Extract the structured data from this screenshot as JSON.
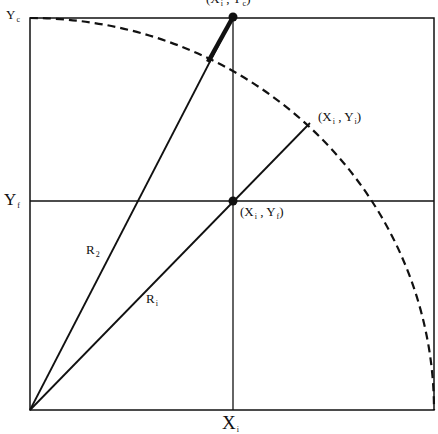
{
  "diagram": {
    "labels": {
      "y_c": {
        "main": "Y",
        "sub": "c"
      },
      "y_f": {
        "main": "Y",
        "sub": "f"
      },
      "x_i": {
        "main": "X",
        "sub": "i"
      },
      "r2": {
        "main": "R",
        "sub": "2"
      },
      "r1": {
        "main": "R",
        "sub": "i"
      },
      "point_xi_yi": {
        "open": "(X",
        "sub1": "i",
        "mid": " , Y",
        "sub2": "i",
        "close": ")"
      },
      "point_xi_yf": {
        "open": "(X",
        "sub1": "i",
        "mid": " , Y",
        "sub2": "f",
        "close": ")"
      },
      "point_top": {
        "open": "(X",
        "sub1": "i",
        "mid": " , Y",
        "sub2": "c",
        "close": ")"
      }
    },
    "colors": {
      "stroke": "#111111",
      "background": "#ffffff"
    }
  }
}
